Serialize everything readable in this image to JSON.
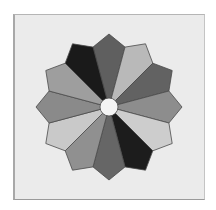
{
  "figure": {
    "blade_count": 12,
    "center": {
      "x": 109,
      "y": 107,
      "radius": 9,
      "fill": "#f4f4f4"
    },
    "tip_radius": 73,
    "shoulder_radius": 62,
    "shoulder_half_angle_deg": 14.5,
    "stroke": "#4a4a4a",
    "background": "#ebebeb",
    "blades": [
      {
        "angle_deg": 0,
        "fill": "#5f5f5f"
      },
      {
        "angle_deg": 30,
        "fill": "#b9b9b9"
      },
      {
        "angle_deg": 60,
        "fill": "#626262"
      },
      {
        "angle_deg": 90,
        "fill": "#8d8d8d"
      },
      {
        "angle_deg": 120,
        "fill": "#cdcdcd"
      },
      {
        "angle_deg": 150,
        "fill": "#1c1c1c"
      },
      {
        "angle_deg": 180,
        "fill": "#666666"
      },
      {
        "angle_deg": 210,
        "fill": "#909090"
      },
      {
        "angle_deg": 240,
        "fill": "#c9c9c9"
      },
      {
        "angle_deg": 270,
        "fill": "#8a8a8a"
      },
      {
        "angle_deg": 300,
        "fill": "#9e9e9e"
      },
      {
        "angle_deg": 330,
        "fill": "#1a1a1a"
      }
    ]
  }
}
